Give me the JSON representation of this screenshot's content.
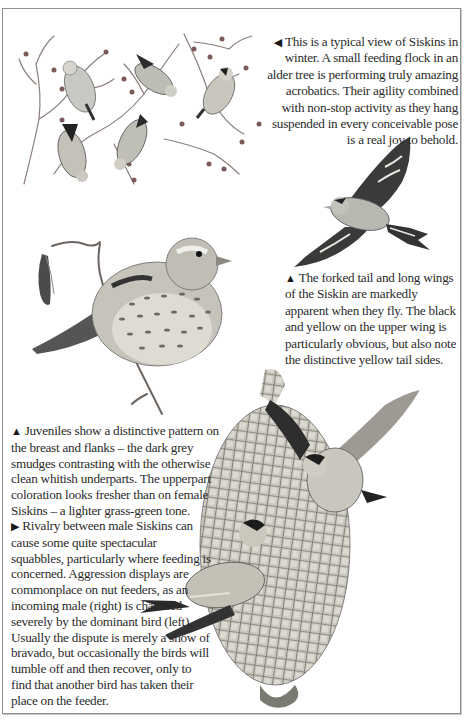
{
  "page": {
    "background": "#ffffff",
    "frame_color": "#8f8f8f"
  },
  "illustrations": [
    {
      "id": "flock",
      "description": "Flock of six Siskins feeding in alder tree branches in winter"
    },
    {
      "id": "flying",
      "description": "Siskin in flight showing forked tail and long wings"
    },
    {
      "id": "juvenile",
      "description": "Juvenile Siskin perched on alder twig with catkins"
    },
    {
      "id": "feeder",
      "description": "Two male Siskins squabbling on a mesh nut feeder"
    }
  ],
  "captions": {
    "winter": {
      "pointer": "◀",
      "text": "This is a typical view of Siskins in winter. A small feeding flock in an alder tree is performing truly amazing acrobatics. Their agility combined with non-stop activity as they hang suspended in every conceivable pose is a real joy to behold."
    },
    "flight": {
      "pointer": "▲",
      "text": "The forked tail and long wings of the Siskin are markedly apparent when they fly. The black and yellow on the upper wing is particularly obvious, but also note the distinctive yellow tail sides."
    },
    "juvenile": {
      "pointer": "▲",
      "text": "Juveniles show a distinctive pattern on the breast and flanks – the dark grey smudges contrasting with the otherwise clean whitish underparts. The upperpart coloration looks fresher than on female Siskins – a lighter grass-green tone."
    },
    "rivalry": {
      "pointer": "▶",
      "text": "Rivalry between male Siskins can cause some quite spectacular squabbles, particularly where feeding is concerned. Aggression displays are commonplace on nut feeders, as an incoming male (right) is chastised severely by the dominant bird (left). Usually the dispute is merely a show of bravado, but occasionally the birds will tumble off and then recover, only to find that another bird has taken their place on the feeder."
    }
  }
}
